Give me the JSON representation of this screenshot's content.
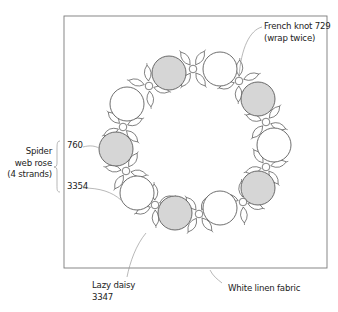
{
  "diagram": {
    "colors": {
      "frame": "#7a7a7a",
      "outline": "#4a4a4a",
      "rose_fill_gray": "#d6d6d6",
      "rose_fill_white": "#ffffff",
      "leader": "#9a9a9a",
      "text": "#222222"
    },
    "frame": {
      "x": 64,
      "y": 16,
      "width": 263,
      "height": 252
    },
    "roses": [
      {
        "cx": 169,
        "cy": 73,
        "r": 17,
        "fill": "gray"
      },
      {
        "cx": 220,
        "cy": 69,
        "r": 17,
        "fill": "white"
      },
      {
        "cx": 258,
        "cy": 99,
        "r": 17,
        "fill": "gray"
      },
      {
        "cx": 274,
        "cy": 145,
        "r": 17,
        "fill": "white"
      },
      {
        "cx": 258,
        "cy": 188,
        "r": 17,
        "fill": "gray"
      },
      {
        "cx": 220,
        "cy": 208,
        "r": 17,
        "fill": "white"
      },
      {
        "cx": 175,
        "cy": 213,
        "r": 17,
        "fill": "gray"
      },
      {
        "cx": 137,
        "cy": 193,
        "r": 17,
        "fill": "white"
      },
      {
        "cx": 116,
        "cy": 149,
        "r": 17,
        "fill": "gray"
      },
      {
        "cx": 127,
        "cy": 104,
        "r": 17,
        "fill": "white"
      }
    ],
    "knots": [
      {
        "cx": 193,
        "cy": 69
      },
      {
        "cx": 239,
        "cy": 81
      },
      {
        "cx": 266,
        "cy": 122
      },
      {
        "cx": 266,
        "cy": 167
      },
      {
        "cx": 243,
        "cy": 202
      },
      {
        "cx": 199,
        "cy": 214
      },
      {
        "cx": 155,
        "cy": 205
      },
      {
        "cx": 126,
        "cy": 171
      },
      {
        "cx": 123,
        "cy": 127
      },
      {
        "cx": 149,
        "cy": 86
      }
    ],
    "labels": {
      "french_knot_line1": "French knot 729",
      "french_knot_line2": "(wrap twice)",
      "spider_line1": "Spider",
      "spider_line2": "web rose",
      "spider_line3": "(4 strands)",
      "color_760": "760",
      "color_3354": "3354",
      "lazy_daisy_line1": "Lazy daisy",
      "lazy_daisy_line2": "3347",
      "fabric": "White linen fabric"
    },
    "leaders": [
      {
        "name": "french-knot-leader",
        "d": "M262 27 C250 30 241 48 239 77"
      },
      {
        "name": "760-leader",
        "d": "M83 147 C90 145 95 146 99 148"
      },
      {
        "name": "3354-leader",
        "d": "M83 188 C100 188 112 192 121 200"
      },
      {
        "name": "lazy-daisy-leader",
        "d": "M127 277 C130 262 136 245 146 233"
      },
      {
        "name": "fabric-leader",
        "d": "M210 270 C213 276 217 279 222 283"
      }
    ],
    "brace": {
      "name": "spider-web-rose-brace",
      "d": "M60 141 C57 141 57 144 57 150 L57 163 C57 166 56 167 54 167 C56 167 57 168 57 171 L57 185 C57 190 57 192 60 192"
    }
  }
}
